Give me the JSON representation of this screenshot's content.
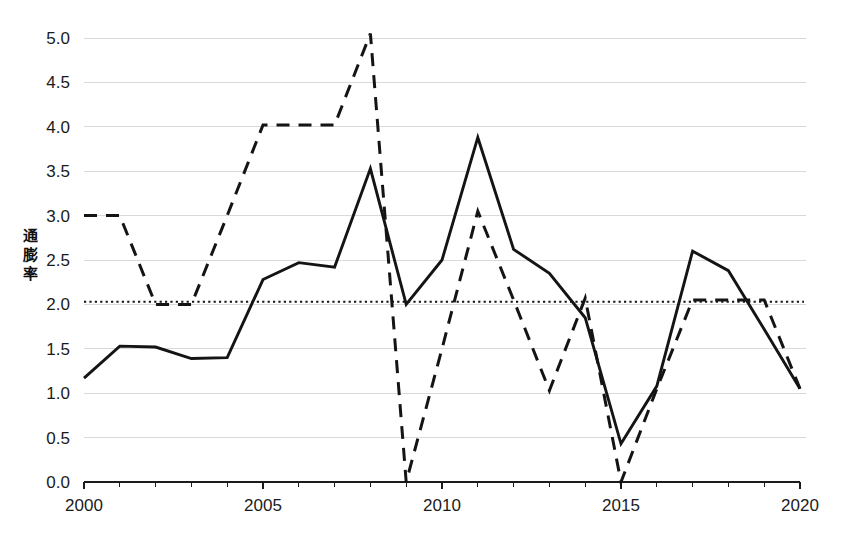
{
  "chart_data": {
    "type": "line",
    "title": "",
    "xlabel": "",
    "ylabel": "通膨率",
    "xlim": [
      2000,
      2020
    ],
    "ylim": [
      0.0,
      5.0
    ],
    "grid": true,
    "legend": "none",
    "y_ticks": [
      "0.0",
      "0.5",
      "1.0",
      "1.5",
      "2.0",
      "2.5",
      "3.0",
      "3.5",
      "4.0",
      "4.5",
      "5.0"
    ],
    "y_tick_values": [
      0.0,
      0.5,
      1.0,
      1.5,
      2.0,
      2.5,
      3.0,
      3.5,
      4.0,
      4.5,
      5.0
    ],
    "x_ticks": [
      "2000",
      "2005",
      "2010",
      "2015",
      "2020"
    ],
    "x_tick_values": [
      2000,
      2005,
      2010,
      2015,
      2020
    ],
    "x_minor_step": 1,
    "x": [
      2000,
      2001,
      2002,
      2003,
      2004,
      2005,
      2006,
      2007,
      2008,
      2009,
      2010,
      2011,
      2012,
      2013,
      2014,
      2015,
      2016,
      2017,
      2018,
      2019,
      2020
    ],
    "series": [
      {
        "name": "solid-series",
        "style": "solid",
        "color": "#141414",
        "values": [
          1.17,
          1.53,
          1.52,
          1.39,
          1.4,
          2.28,
          2.47,
          2.42,
          3.53,
          2.0,
          2.5,
          3.88,
          2.62,
          2.35,
          1.85,
          0.43,
          1.08,
          2.6,
          2.38,
          1.72,
          1.05
        ]
      },
      {
        "name": "dashed-series",
        "style": "dashed",
        "color": "#141414",
        "values": [
          3.0,
          3.0,
          2.0,
          2.0,
          3.0,
          4.02,
          4.02,
          4.02,
          5.05,
          0.0,
          1.5,
          3.05,
          2.05,
          1.03,
          2.07,
          0.0,
          1.05,
          2.05,
          2.05,
          2.05,
          1.05
        ]
      }
    ],
    "reference_line": {
      "name": "target-2-percent",
      "style": "dotted",
      "value": 2.03,
      "color": "#141414"
    }
  },
  "layout": {
    "plot_left": 84,
    "plot_right": 800,
    "plot_top": 38,
    "plot_bottom": 482
  }
}
